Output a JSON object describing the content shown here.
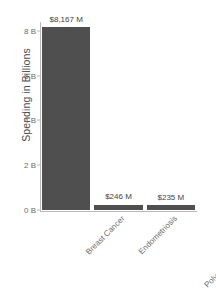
{
  "chart_data": {
    "type": "bar",
    "title": "",
    "subtitle": "",
    "xlabel": "",
    "ylabel": "Spending in Billions",
    "categories": [
      "Breast Cancer",
      "Endometriosis",
      "Polycystic Ovary Syndrome"
    ],
    "values": [
      8167000000,
      246000000,
      235000000
    ],
    "value_labels": [
      "$8,167 M",
      "$246 M",
      "$235 M"
    ],
    "ylim": [
      0,
      8400000000
    ],
    "ytick_values": [
      0,
      2000000000,
      4000000000,
      6000000000,
      8000000000
    ],
    "ytick_labels": [
      "0 B",
      "2 B",
      "4 B",
      "6 B",
      "8 B"
    ],
    "grid": false,
    "legend": false,
    "legend_position": "none",
    "bar_color": "#4f4f4f",
    "axis_color": "#b9b9b9",
    "text_color": "#6b6b6b",
    "background": "#ffffff"
  }
}
